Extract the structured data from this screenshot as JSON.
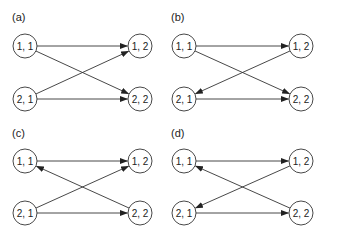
{
  "figure": {
    "node_radius": 12,
    "panels": [
      {
        "id": "a",
        "label": "(a)",
        "label_pos": [
          12,
          21
        ],
        "nodes": [
          {
            "id": "11",
            "label": "1, 1",
            "x": 25,
            "y": 46
          },
          {
            "id": "21",
            "label": "2, 1",
            "x": 25,
            "y": 99
          },
          {
            "id": "12",
            "label": "1, 2",
            "x": 140,
            "y": 46
          },
          {
            "id": "22",
            "label": "2, 2",
            "x": 140,
            "y": 99
          }
        ],
        "edges": [
          {
            "from": "11",
            "to": "12"
          },
          {
            "from": "11",
            "to": "22"
          },
          {
            "from": "21",
            "to": "12"
          },
          {
            "from": "21",
            "to": "22"
          }
        ]
      },
      {
        "id": "b",
        "label": "(b)",
        "label_pos": [
          171,
          21
        ],
        "nodes": [
          {
            "id": "11",
            "label": "1, 1",
            "x": 184,
            "y": 46
          },
          {
            "id": "21",
            "label": "2, 1",
            "x": 184,
            "y": 99
          },
          {
            "id": "12",
            "label": "1, 2",
            "x": 301,
            "y": 46
          },
          {
            "id": "22",
            "label": "2, 2",
            "x": 301,
            "y": 99
          }
        ],
        "edges": [
          {
            "from": "11",
            "to": "12"
          },
          {
            "from": "11",
            "to": "22"
          },
          {
            "from": "12",
            "to": "21"
          },
          {
            "from": "21",
            "to": "22"
          }
        ]
      },
      {
        "id": "c",
        "label": "(c)",
        "label_pos": [
          12,
          137
        ],
        "nodes": [
          {
            "id": "11",
            "label": "1, 1",
            "x": 25,
            "y": 161
          },
          {
            "id": "21",
            "label": "2, 1",
            "x": 25,
            "y": 213
          },
          {
            "id": "12",
            "label": "1, 2",
            "x": 140,
            "y": 161
          },
          {
            "id": "22",
            "label": "2, 2",
            "x": 140,
            "y": 213
          }
        ],
        "edges": [
          {
            "from": "11",
            "to": "12"
          },
          {
            "from": "22",
            "to": "11"
          },
          {
            "from": "21",
            "to": "12"
          },
          {
            "from": "21",
            "to": "22"
          }
        ]
      },
      {
        "id": "d",
        "label": "(d)",
        "label_pos": [
          171,
          137
        ],
        "nodes": [
          {
            "id": "11",
            "label": "1, 1",
            "x": 184,
            "y": 161
          },
          {
            "id": "21",
            "label": "2, 1",
            "x": 184,
            "y": 213
          },
          {
            "id": "12",
            "label": "1, 2",
            "x": 301,
            "y": 161
          },
          {
            "id": "22",
            "label": "2, 2",
            "x": 301,
            "y": 213
          }
        ],
        "edges": [
          {
            "from": "11",
            "to": "12"
          },
          {
            "from": "22",
            "to": "11"
          },
          {
            "from": "12",
            "to": "21"
          },
          {
            "from": "21",
            "to": "22"
          }
        ]
      }
    ]
  }
}
